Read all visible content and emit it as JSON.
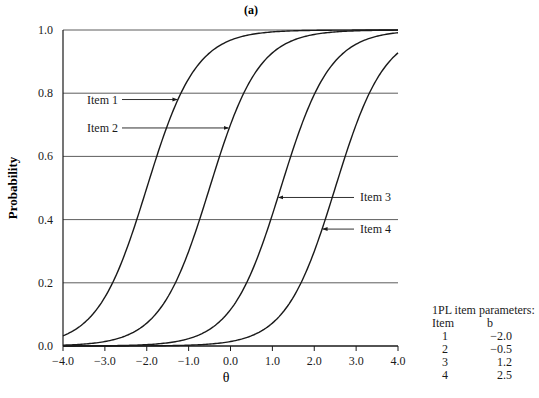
{
  "chart_data": {
    "type": "line",
    "title": "(a)",
    "xlabel": "θ",
    "ylabel": "Probability",
    "xlim": [
      -4.0,
      4.0
    ],
    "ylim": [
      0.0,
      1.0
    ],
    "x_ticks": [
      "−4.0",
      "−3.0",
      "−2.0",
      "−1.0",
      "0.0",
      "1.0",
      "2.0",
      "3.0",
      "4.0"
    ],
    "y_ticks": [
      "0.0",
      "0.2",
      "0.4",
      "0.6",
      "0.8",
      "1.0"
    ],
    "grid": "horizontal",
    "model": "1PL logistic, P(θ) = 1 / (1 + exp(−1.7(θ − b)))",
    "series": [
      {
        "name": "Item 1",
        "b": -2.0,
        "label_y": 0.78
      },
      {
        "name": "Item 2",
        "b": -0.5,
        "label_y": 0.69
      },
      {
        "name": "Item 3",
        "b": 1.2,
        "label_y": 0.47
      },
      {
        "name": "Item 4",
        "b": 2.5,
        "label_y": 0.37
      }
    ],
    "annotations": [
      "Item 1",
      "Item 2",
      "Item 3",
      "Item 4"
    ]
  },
  "parameters_table": {
    "title": "1PL item parameters:",
    "headers": [
      "Item",
      "b"
    ],
    "rows": [
      [
        "1",
        "−2.0"
      ],
      [
        "2",
        "−0.5"
      ],
      [
        "3",
        "1.2"
      ],
      [
        "4",
        "2.5"
      ]
    ]
  }
}
